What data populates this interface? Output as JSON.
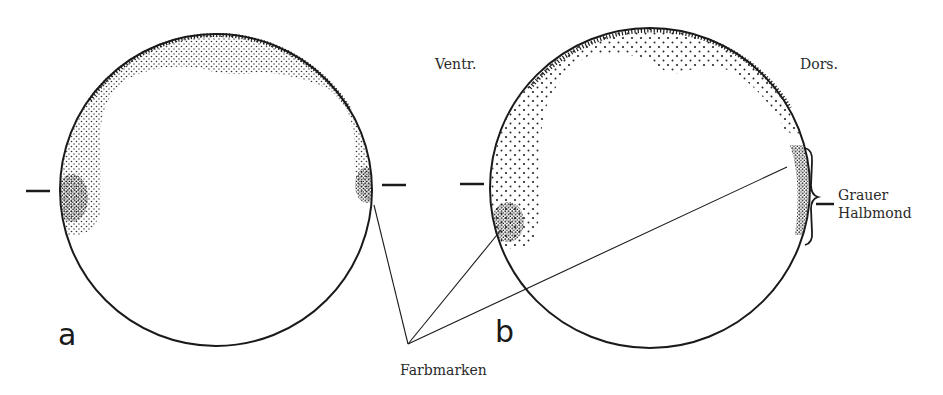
{
  "figure": {
    "panels": [
      {
        "id": "a",
        "letter": "a"
      },
      {
        "id": "b",
        "letter": "b"
      }
    ],
    "labels": {
      "ventral": "Ventr.",
      "dorsal": "Dors.",
      "grey_crescent_line1": "Grauer",
      "grey_crescent_line2": "Halbmond",
      "color_marks": "Farbmarken"
    },
    "colors": {
      "ink": "#1a1a1a",
      "background": "#ffffff"
    }
  }
}
